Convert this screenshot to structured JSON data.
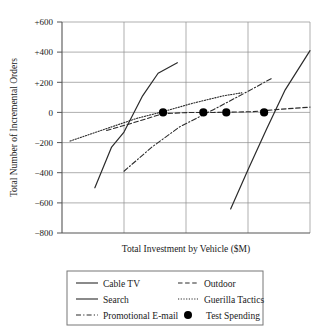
{
  "chart_data": {
    "type": "line",
    "title": "",
    "xlabel": "Total Investment by Vehicle ($M)",
    "ylabel": "Total Number of Incremental Orders",
    "ylim": [
      -800,
      600
    ],
    "xlim": [
      0,
      4
    ],
    "yticks": [
      "+600",
      "+400",
      "+200",
      "0",
      "−200",
      "−400",
      "−600",
      "−800"
    ],
    "ytick_values": [
      600,
      400,
      200,
      0,
      -200,
      -400,
      -600,
      -800
    ],
    "xticks": [],
    "xtick_values": [
      1,
      2,
      3
    ],
    "grid": "both",
    "legend_position": "bottom-outside",
    "series": [
      {
        "name": "Cable TV",
        "style": "solid",
        "points": [
          [
            0.53,
            -500
          ],
          [
            0.8,
            -230
          ],
          [
            1.0,
            -130
          ],
          [
            1.3,
            110
          ],
          [
            1.55,
            260
          ],
          [
            1.86,
            330
          ]
        ]
      },
      {
        "name": "Search",
        "style": "solid",
        "points": [
          [
            2.72,
            -640
          ],
          [
            3.0,
            -380
          ],
          [
            3.3,
            -110
          ],
          [
            3.6,
            150
          ],
          [
            4.0,
            410
          ]
        ]
      },
      {
        "name": "Promotional E-mail",
        "style": "dash-dot",
        "points": [
          [
            1.0,
            -390
          ],
          [
            1.45,
            -230
          ],
          [
            1.9,
            -95
          ],
          [
            2.45,
            20
          ],
          [
            3.0,
            140
          ],
          [
            3.4,
            230
          ]
        ]
      },
      {
        "name": "Outdoor",
        "style": "dashed",
        "points": [
          [
            0.72,
            -120
          ],
          [
            1.1,
            -75
          ],
          [
            1.63,
            -8
          ],
          [
            2.08,
            0
          ],
          [
            2.45,
            0
          ],
          [
            3.08,
            5
          ],
          [
            3.55,
            22
          ],
          [
            4.0,
            35
          ]
        ]
      },
      {
        "name": "Guerilla Tactics",
        "style": "dotted",
        "points": [
          [
            0.13,
            -190
          ],
          [
            0.7,
            -110
          ],
          [
            1.2,
            -40
          ],
          [
            1.63,
            5
          ],
          [
            2.1,
            60
          ],
          [
            2.6,
            110
          ],
          [
            2.9,
            130
          ]
        ]
      },
      {
        "name": "Test Spending",
        "style": "marker",
        "points": [
          [
            1.63,
            0
          ],
          [
            2.28,
            0
          ],
          [
            2.65,
            0
          ],
          [
            3.26,
            0
          ]
        ]
      }
    ]
  },
  "legend": {
    "items": [
      {
        "label": "Cable TV",
        "style": "solid",
        "column": 0
      },
      {
        "label": "Search",
        "style": "solid",
        "column": 0
      },
      {
        "label": "Promotional E-mail",
        "style": "dash-dot",
        "column": 0
      },
      {
        "label": "Outdoor",
        "style": "dashed",
        "column": 1
      },
      {
        "label": "Guerilla Tactics",
        "style": "dotted",
        "column": 1
      },
      {
        "label": "Test Spending",
        "style": "marker",
        "column": 1
      }
    ]
  },
  "colors": {
    "line": "#2b2b2b",
    "grid": "#8c8c8c",
    "axis": "#555555",
    "marker": "#000000",
    "background": "#ffffff"
  }
}
